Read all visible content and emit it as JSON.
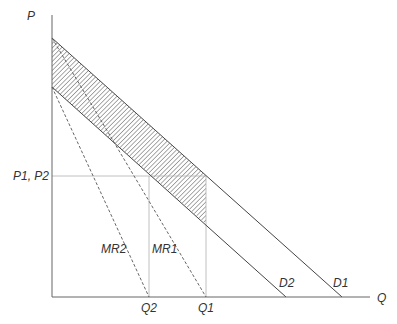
{
  "diagram": {
    "axes": {
      "y_label": "P",
      "x_label": "Q"
    },
    "price_label": "P1, P2",
    "quantity_labels": {
      "q1": "Q1",
      "q2": "Q2"
    },
    "curves": {
      "d1": "D1",
      "d2": "D2",
      "mr1": "MR1",
      "mr2": "MR2"
    },
    "colors": {
      "line": "#444444",
      "guide": "#9a9a9a",
      "hatch": "#555555",
      "text": "#333333"
    }
  }
}
